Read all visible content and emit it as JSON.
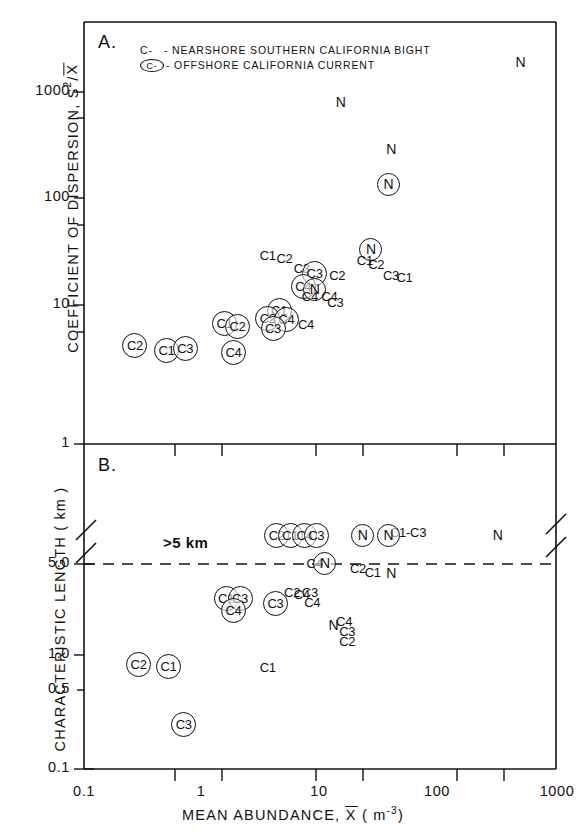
{
  "figure": {
    "xaxis": {
      "label_main": "MEAN ABUNDANCE,",
      "label_var": "X",
      "label_units": "( m",
      "label_units_exp": "-3",
      "label_units_close": ")",
      "ticks": [
        "0.1",
        "1",
        "10",
        "100",
        "1000"
      ],
      "scale": "log",
      "range": [
        0.1,
        1000
      ]
    },
    "panelA": {
      "letter": "A.",
      "ylabel_main": "COEFFICIENT OF DISPERSION, S",
      "ylabel_exp": "2",
      "ylabel_div": "/X",
      "yticks": [
        "1000",
        "100",
        "10",
        "1"
      ],
      "yscale": "log",
      "yrange": [
        1,
        3000
      ],
      "legend": [
        {
          "symbol": "C-",
          "circled": false,
          "text": "- NEARSHORE SOUTHERN CALIFORNIA BIGHT"
        },
        {
          "symbol": "C-",
          "circled": true,
          "text": "- OFFSHORE CALIFORNIA CURRENT"
        }
      ]
    },
    "panelB": {
      "letter": "B.",
      "ylabel": "CHARACTERISTIC LENGTH ( km )",
      "yticks": [
        "5.0",
        "1.0",
        "0.5",
        "0.1"
      ],
      "annotation": ">5 km",
      "axis_break": true,
      "dashed_line_value": "5.0"
    }
  },
  "chart_data": {
    "type": "scatter",
    "title": "",
    "xlabel": "MEAN ABUNDANCE, X (m-3)",
    "panels": [
      {
        "id": "A",
        "ylabel": "COEFFICIENT OF DISPERSION, S2/X",
        "xscale": "log",
        "yscale": "log",
        "xlim": [
          0.1,
          1000
        ],
        "ylim": [
          1,
          3000
        ],
        "grid": false,
        "legend_position": "top-left",
        "points": [
          {
            "label": "N",
            "circled": false,
            "x": 15,
            "y": 800
          },
          {
            "label": "N",
            "circled": false,
            "x": 500,
            "y": 1900
          },
          {
            "label": "N",
            "circled": false,
            "x": 40,
            "y": 290
          },
          {
            "label": "N",
            "circled": true,
            "x": 38,
            "y": 135
          },
          {
            "label": "N",
            "circled": true,
            "x": 27,
            "y": 33
          },
          {
            "label": "C1",
            "circled": false,
            "x": 24,
            "y": 26
          },
          {
            "label": "C2",
            "circled": false,
            "x": 30,
            "y": 24
          },
          {
            "label": "C3",
            "circled": false,
            "x": 40,
            "y": 19
          },
          {
            "label": "C1",
            "circled": false,
            "x": 52,
            "y": 18
          },
          {
            "label": "C1",
            "circled": false,
            "x": 3.6,
            "y": 29
          },
          {
            "label": "C2",
            "circled": false,
            "x": 5.0,
            "y": 27
          },
          {
            "label": "C3",
            "circled": false,
            "x": 7.0,
            "y": 22
          },
          {
            "label": "C3",
            "circled": true,
            "x": 9.0,
            "y": 20
          },
          {
            "label": "C2",
            "circled": false,
            "x": 14,
            "y": 19
          },
          {
            "label": "C4",
            "circled": true,
            "x": 7.2,
            "y": 15
          },
          {
            "label": "N",
            "circled": true,
            "x": 9.0,
            "y": 14
          },
          {
            "label": "C4",
            "circled": false,
            "x": 8.2,
            "y": 12
          },
          {
            "label": "C4",
            "circled": false,
            "x": 12,
            "y": 12
          },
          {
            "label": "C3",
            "circled": false,
            "x": 13.5,
            "y": 10.5
          },
          {
            "label": "C1",
            "circled": true,
            "x": 4.5,
            "y": 9.0
          },
          {
            "label": "C2",
            "circled": true,
            "x": 3.6,
            "y": 7.5
          },
          {
            "label": "C4",
            "circled": true,
            "x": 5.2,
            "y": 7.3
          },
          {
            "label": "C3",
            "circled": true,
            "x": 4.0,
            "y": 6.0
          },
          {
            "label": "C4",
            "circled": false,
            "x": 7.6,
            "y": 6.5
          },
          {
            "label": "C1",
            "circled": true,
            "x": 1.55,
            "y": 6.7
          },
          {
            "label": "C2",
            "circled": true,
            "x": 2.0,
            "y": 6.3
          },
          {
            "label": "C4",
            "circled": true,
            "x": 1.85,
            "y": 3.6
          },
          {
            "label": "C2",
            "circled": true,
            "x": 0.27,
            "y": 4.2
          },
          {
            "label": "C1",
            "circled": true,
            "x": 0.5,
            "y": 3.8
          },
          {
            "label": "C3",
            "circled": true,
            "x": 0.72,
            "y": 3.9
          }
        ]
      },
      {
        "id": "B",
        "ylabel": "CHARACTERISTIC LENGTH ( km )",
        "xscale": "log",
        "yscale": "log",
        "xlim": [
          0.1,
          1000
        ],
        "ylim": [
          0.1,
          5.0
        ],
        "grid": false,
        "annotations": [
          {
            "text": ">5 km",
            "x": 1.35,
            "y": 5.6
          },
          {
            "text": "C1-C3",
            "x": 23,
            "y": 6.6
          }
        ],
        "points": [
          {
            "label": "C2",
            "circled": true,
            "x": 4.3,
            "y": 5.8
          },
          {
            "label": "C1",
            "circled": true,
            "x": 5.6,
            "y": 5.8
          },
          {
            "label": "C4",
            "circled": true,
            "x": 7.4,
            "y": 5.8
          },
          {
            "label": "C3",
            "circled": true,
            "x": 9.3,
            "y": 5.8
          },
          {
            "label": "N",
            "circled": true,
            "x": 23,
            "y": 5.8
          },
          {
            "label": "N",
            "circled": true,
            "x": 38,
            "y": 5.8
          },
          {
            "label": "N",
            "circled": false,
            "x": 320,
            "y": 5.8
          },
          {
            "label": "C4",
            "circled": false,
            "x": 9.0,
            "y": 5.0
          },
          {
            "label": "N",
            "circled": true,
            "x": 11,
            "y": 5.0
          },
          {
            "label": "C2",
            "circled": false,
            "x": 21,
            "y": 4.6
          },
          {
            "label": "C1",
            "circled": false,
            "x": 28,
            "y": 4.3
          },
          {
            "label": "N",
            "circled": false,
            "x": 40,
            "y": 4.3
          },
          {
            "label": "C2",
            "circled": false,
            "x": 5.8,
            "y": 3.0
          },
          {
            "label": "C4",
            "circled": false,
            "x": 7.0,
            "y": 2.9
          },
          {
            "label": "C3",
            "circled": false,
            "x": 8.2,
            "y": 3.0
          },
          {
            "label": "C4",
            "circled": false,
            "x": 8.6,
            "y": 2.5
          },
          {
            "label": "C3",
            "circled": true,
            "x": 4.2,
            "y": 2.5
          },
          {
            "label": "C1",
            "circled": true,
            "x": 1.6,
            "y": 2.7
          },
          {
            "label": "C3",
            "circled": true,
            "x": 2.1,
            "y": 2.7
          },
          {
            "label": "C4",
            "circled": true,
            "x": 1.85,
            "y": 2.2
          },
          {
            "label": "N",
            "circled": false,
            "x": 13,
            "y": 1.7
          },
          {
            "label": "C4",
            "circled": false,
            "x": 16,
            "y": 1.8
          },
          {
            "label": "C3",
            "circled": false,
            "x": 17,
            "y": 1.5
          },
          {
            "label": "C2",
            "circled": false,
            "x": 17,
            "y": 1.25
          },
          {
            "label": "C1",
            "circled": false,
            "x": 3.6,
            "y": 0.8
          },
          {
            "label": "C2",
            "circled": true,
            "x": 0.29,
            "y": 0.85
          },
          {
            "label": "C1",
            "circled": true,
            "x": 0.52,
            "y": 0.82
          },
          {
            "label": "C3",
            "circled": true,
            "x": 0.7,
            "y": 0.29
          }
        ]
      }
    ]
  }
}
